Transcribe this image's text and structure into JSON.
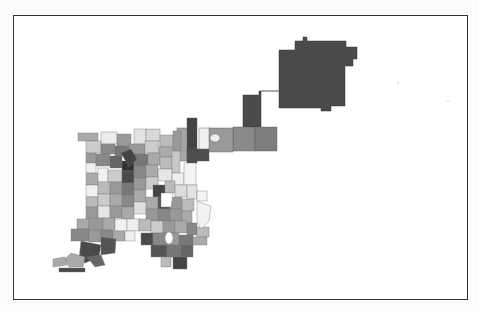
{
  "map": {
    "type": "choropleth",
    "region": "Denver census tracts",
    "shading": "grayscale",
    "colors": {
      "darkest": "#3e3e3e",
      "dark": "#5c5c5c",
      "mid_dark": "#7a7a7a",
      "mid": "#999999",
      "light": "#b8b8b8",
      "lighter": "#d2d2d2",
      "lightest": "#ececec"
    },
    "legend": null,
    "title": null
  }
}
